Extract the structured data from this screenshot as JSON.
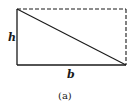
{
  "diagram": {
    "type": "rectangle-split-by-diagonal",
    "labels": {
      "height": "h",
      "base": "b",
      "caption": "(a)"
    },
    "colors": {
      "stroke": "#1a1a1a",
      "background": "#ffffff"
    },
    "edges": {
      "left": "solid",
      "bottom": "solid",
      "diagonal": "solid",
      "top": "dashed",
      "right": "dashed"
    }
  }
}
